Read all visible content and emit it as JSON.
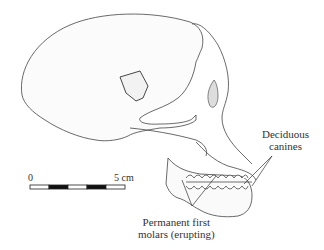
{
  "figure": {
    "labels": {
      "deciduous_canines_line1": "Deciduous",
      "deciduous_canines_line2": "canines",
      "molars_line1": "Permanent first",
      "molars_line2": "molars (erupting)"
    },
    "scale_bar": {
      "start_label": "0",
      "end_label": "5 cm",
      "segments": 5
    }
  }
}
